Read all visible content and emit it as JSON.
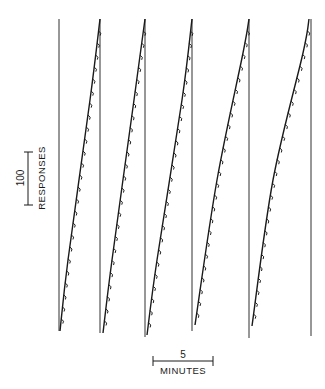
{
  "chart_data": {
    "type": "line",
    "title": "",
    "subtype": "cumulative record",
    "xlabel": "",
    "ylabel": "",
    "grid": false,
    "legend": null,
    "scale_bars": {
      "vertical": {
        "value": "100",
        "label": "RESPONSES"
      },
      "horizontal": {
        "value": "5",
        "label": "MINUTES"
      }
    },
    "records_note": "Five successive cumulative response records; pen resets to baseline after each segment. Small downward pips mark reinforcements.",
    "series": [
      {
        "name": "record-1",
        "points_px": [
          [
            60,
            331
          ],
          [
            68,
            260
          ],
          [
            90,
            100
          ],
          [
            100,
            19
          ]
        ]
      },
      {
        "name": "record-2",
        "points_px": [
          [
            103,
            333
          ],
          [
            112,
            260
          ],
          [
            134,
            100
          ],
          [
            145,
            19
          ]
        ]
      },
      {
        "name": "record-3",
        "points_px": [
          [
            147,
            335
          ],
          [
            157,
            260
          ],
          [
            182,
            100
          ],
          [
            192,
            19
          ]
        ]
      },
      {
        "name": "record-4",
        "points_px": [
          [
            195,
            325
          ],
          [
            217,
            180
          ],
          [
            243,
            53
          ],
          [
            249,
            19
          ]
        ]
      },
      {
        "name": "record-5",
        "points_px": [
          [
            252,
            326
          ],
          [
            273,
            180
          ],
          [
            303,
            53
          ],
          [
            309,
            19
          ]
        ]
      }
    ],
    "baselines_px": [
      {
        "x": 59,
        "top": 19,
        "bottom": 331
      },
      {
        "x": 100,
        "top": 19,
        "bottom": 333
      },
      {
        "x": 145,
        "top": 19,
        "bottom": 337
      },
      {
        "x": 192,
        "top": 19,
        "bottom": 331
      },
      {
        "x": 249,
        "top": 19,
        "bottom": 338
      },
      {
        "x": 311,
        "top": 19,
        "bottom": 336
      }
    ]
  },
  "labels": {
    "y_value": "100",
    "y_unit": "RESPONSES",
    "x_value": "5",
    "x_unit": "MINUTES"
  },
  "colors": {
    "ink": "#1a1a1a",
    "background": "#ffffff"
  }
}
